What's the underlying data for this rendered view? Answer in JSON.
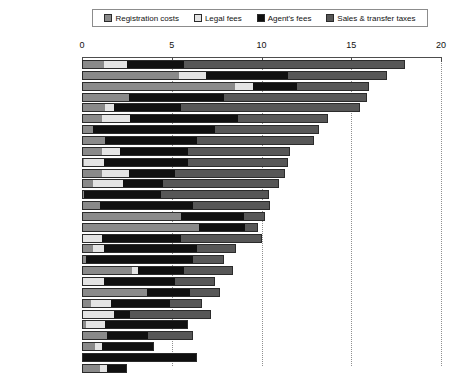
{
  "legend": {
    "items": [
      {
        "label": "Registration costs",
        "color": "#8a8a8a",
        "key": "registration"
      },
      {
        "label": "Legal fees",
        "color": "#e4e4e4",
        "key": "legal"
      },
      {
        "label": "Agent's fees",
        "color": "#101010",
        "key": "agent"
      },
      {
        "label": "Sales & transfer taxes",
        "color": "#575757",
        "key": "sales"
      }
    ]
  },
  "axis": {
    "ticks": [
      0,
      5,
      10,
      15,
      20
    ],
    "tick_labels": [
      "0",
      "5",
      "10",
      "15",
      "20"
    ],
    "min": 0,
    "max": 20
  },
  "chart_data": {
    "type": "bar",
    "orientation": "horizontal",
    "stacked": true,
    "title": "",
    "xlabel": "",
    "ylabel": "",
    "xlim": [
      0,
      20
    ],
    "grid": true,
    "legend_position": "top",
    "categories": [
      "Belgium",
      "Italy",
      "France",
      "Luxembourg",
      "Greece",
      "Portugal",
      "Mexico",
      "Spain",
      "Austria",
      "Germany",
      "Netherlands",
      "Hungary",
      "Norway",
      "Poland",
      "Finland",
      "Turkey",
      "Czech Rep.",
      "USA",
      "Japan",
      "Canada",
      "Rep. of Ireland",
      "Sweden",
      "Iceland",
      "Australia",
      "Switzerland",
      "New Zealand",
      "United Kingdom",
      "Slovakia",
      "Denmark"
    ],
    "series": [
      {
        "name": "Registration costs",
        "color": "#8a8a8a",
        "values": [
          1.2,
          5.4,
          8.5,
          2.6,
          1.3,
          1.1,
          0.6,
          1.3,
          1.1,
          0.1,
          1.1,
          0.6,
          0.1,
          1.0,
          5.5,
          6.5,
          0.0,
          0.6,
          0.2,
          2.8,
          0.0,
          3.6,
          0.5,
          0.0,
          0.2,
          1.4,
          0.7,
          0.0,
          1.0
        ]
      },
      {
        "name": "Legal fees",
        "color": "#e4e4e4",
        "values": [
          1.3,
          1.5,
          1.0,
          0.0,
          0.5,
          1.6,
          0.0,
          0.0,
          1.0,
          1.1,
          1.5,
          1.7,
          0.0,
          0.0,
          0.0,
          0.0,
          1.1,
          0.6,
          0.0,
          0.3,
          1.2,
          0.0,
          1.1,
          1.8,
          1.1,
          0.0,
          0.4,
          0.0,
          0.4
        ]
      },
      {
        "name": "Agent's fees",
        "color": "#101010",
        "values": [
          3.2,
          4.6,
          2.5,
          5.3,
          3.7,
          6.0,
          6.8,
          5.1,
          3.8,
          4.7,
          2.6,
          2.2,
          4.3,
          5.2,
          3.5,
          2.6,
          4.4,
          5.2,
          6.0,
          2.6,
          4.0,
          2.4,
          3.3,
          0.9,
          4.6,
          2.3,
          2.9,
          6.4,
          1.1
        ]
      },
      {
        "name": "Sales & transfer taxes",
        "color": "#575757",
        "values": [
          12.3,
          5.5,
          4.0,
          8.0,
          10.0,
          5.0,
          5.8,
          6.5,
          5.7,
          5.6,
          6.1,
          6.5,
          6.0,
          4.3,
          1.2,
          0.7,
          4.5,
          2.2,
          1.7,
          2.7,
          2.2,
          1.7,
          1.8,
          4.5,
          0.0,
          2.5,
          0.0,
          0.0,
          0.0
        ]
      }
    ],
    "totals": [
      18.0,
      17.0,
      16.0,
      15.9,
      15.5,
      13.7,
      13.2,
      12.9,
      11.6,
      11.5,
      11.3,
      11.0,
      10.4,
      10.5,
      10.2,
      9.8,
      10.0,
      8.6,
      7.9,
      8.4,
      7.4,
      7.7,
      6.7,
      7.2,
      5.9,
      6.2,
      4.0,
      6.4,
      2.5
    ]
  }
}
